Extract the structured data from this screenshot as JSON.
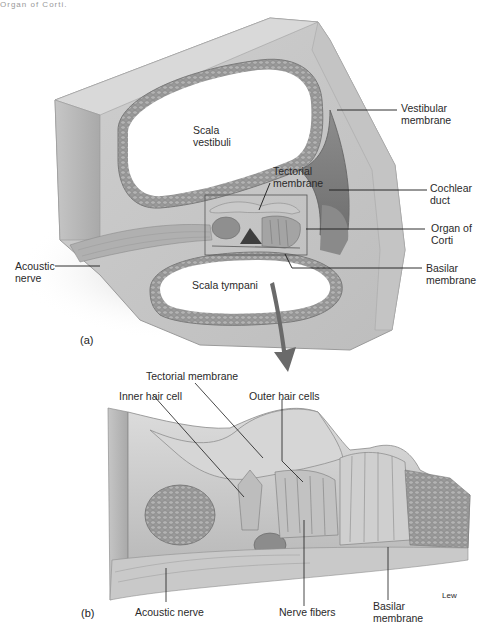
{
  "header": {
    "cut_text": "Organ of Corti."
  },
  "panel_a": {
    "panel_label": "(a)",
    "labels": {
      "scala_vestibuli": [
        "Scala",
        "vestibuli"
      ],
      "vestibular_membrane": [
        "Vestibular",
        "membrane"
      ],
      "tectorial_membrane": [
        "Tectorial",
        "membrane"
      ],
      "cochlear_duct": [
        "Cochlear",
        "duct"
      ],
      "organ_of_corti": [
        "Organ of",
        "Corti"
      ],
      "basilar_membrane": [
        "Basilar",
        "membrane"
      ],
      "acoustic_nerve": [
        "Acoustic",
        "nerve"
      ],
      "scala_tympani": "Scala tympani"
    }
  },
  "panel_b": {
    "panel_label": "(b)",
    "labels": {
      "tectorial_membrane": "Tectorial membrane",
      "inner_hair_cell": "Inner hair cell",
      "outer_hair_cells": "Outer hair cells",
      "acoustic_nerve": "Acoustic nerve",
      "nerve_fibers": "Nerve fibers",
      "basilar_membrane": [
        "Basilar",
        "membrane"
      ],
      "signature": "Lew"
    }
  },
  "colors": {
    "tissue_light": "#d4d4d4",
    "tissue_mid": "#b8b8b8",
    "tissue_dark": "#7a7a7a",
    "arrow": "#6a6a6a",
    "leader_line": "#1a1a1a"
  }
}
